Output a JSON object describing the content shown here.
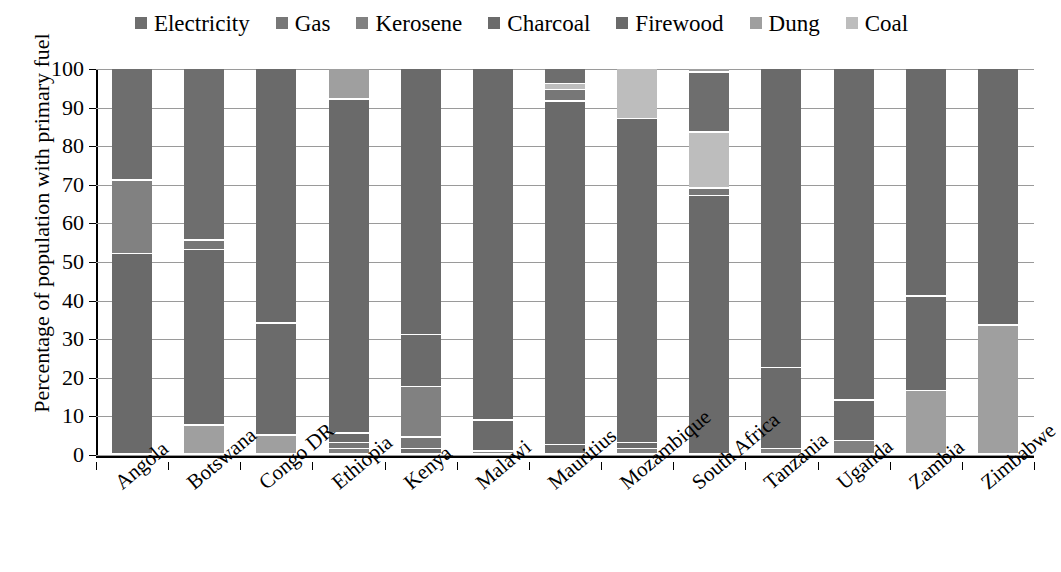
{
  "chart_data": {
    "type": "bar",
    "subtype": "stacked-bar-100",
    "title": "",
    "xlabel": "",
    "ylabel": "Percentage of population with primary fuel",
    "ylim": [
      0,
      100
    ],
    "ytick_labels": [
      "100",
      "90",
      "80",
      "70",
      "60",
      "50",
      "40",
      "30",
      "20",
      "10",
      "0"
    ],
    "yticks": [
      100,
      90,
      80,
      70,
      60,
      50,
      40,
      30,
      20,
      10,
      0
    ],
    "grid": true,
    "legend_position": "top-center",
    "categories": [
      "Angola",
      "Botswana",
      "Congo DR",
      "Ethiopia",
      "Kenya",
      "Malawi",
      "Mauritius",
      "Mozambique",
      "South Africa",
      "Tanzania",
      "Uganda",
      "Zambia",
      "Zimbabwe"
    ],
    "series": [
      {
        "name": "Electricity",
        "color": "#6e6e6e",
        "values": [
          29.0,
          44.5,
          0.0,
          0.0,
          1.5,
          0.0,
          4.0,
          0.0,
          15.5,
          0.0,
          0.0,
          0.0,
          0.0
        ]
      },
      {
        "name": "Gas",
        "color": "#777777",
        "values": [
          0.0,
          2.5,
          0.0,
          1.5,
          3.0,
          0.0,
          3.0,
          0.0,
          2.0,
          0.0,
          0.0,
          0.0,
          0.0
        ]
      },
      {
        "name": "Kerosene",
        "color": "#818181",
        "values": [
          19.0,
          0.0,
          0.0,
          1.5,
          13.0,
          0.8,
          0.0,
          1.5,
          0.0,
          1.5,
          3.5,
          0.0,
          0.0
        ]
      },
      {
        "name": "Charcoal",
        "color": "#6b6b6b",
        "values": [
          0.0,
          0.0,
          29.0,
          2.5,
          13.5,
          8.0,
          0.0,
          1.5,
          0.0,
          21.0,
          10.5,
          24.5,
          0.0
        ]
      },
      {
        "name": "Firewood",
        "color": "#6a6a6a",
        "values": [
          52.0,
          45.5,
          66.0,
          86.5,
          69.0,
          91.2,
          89.0,
          84.0,
          67.0,
          77.5,
          86.0,
          59.0,
          66.5
        ]
      },
      {
        "name": "Dung",
        "color": "#9f9f9f",
        "values": [
          0.0,
          7.5,
          5.0,
          8.0,
          0.0,
          0.0,
          0.0,
          0.0,
          1.0,
          0.0,
          0.0,
          16.5,
          33.5
        ]
      },
      {
        "name": "Coal",
        "color": "#bdbdbd",
        "values": [
          0.0,
          0.0,
          0.0,
          0.0,
          0.0,
          0.0,
          4.0,
          13.0,
          14.5,
          0.0,
          0.0,
          0.0,
          0.0
        ]
      }
    ],
    "stacks": [
      {
        "category": "Angola",
        "segments": [
          {
            "series": "Firewood",
            "from": 0,
            "to": 52.0
          },
          {
            "series": "Kerosene",
            "from": 52.0,
            "to": 71.0
          },
          {
            "series": "Electricity",
            "from": 71.0,
            "to": 100
          }
        ]
      },
      {
        "category": "Botswana",
        "segments": [
          {
            "series": "Dung",
            "from": 0,
            "to": 7.5
          },
          {
            "series": "Firewood",
            "from": 7.5,
            "to": 53.0
          },
          {
            "series": "Gas",
            "from": 53.0,
            "to": 55.5
          },
          {
            "series": "Electricity",
            "from": 55.5,
            "to": 100
          }
        ]
      },
      {
        "category": "Congo DR",
        "segments": [
          {
            "series": "Dung",
            "from": 0,
            "to": 5.0
          },
          {
            "series": "Charcoal",
            "from": 5.0,
            "to": 34.0
          },
          {
            "series": "Firewood",
            "from": 34.0,
            "to": 100
          }
        ]
      },
      {
        "category": "Ethiopia",
        "segments": [
          {
            "series": "Kerosene",
            "from": 0,
            "to": 1.5
          },
          {
            "series": "Gas",
            "from": 1.5,
            "to": 3.0
          },
          {
            "series": "Charcoal",
            "from": 3.0,
            "to": 5.5
          },
          {
            "series": "Firewood",
            "from": 5.5,
            "to": 92.0
          },
          {
            "series": "Dung",
            "from": 92.0,
            "to": 100
          }
        ]
      },
      {
        "category": "Kenya",
        "segments": [
          {
            "series": "Electricity",
            "from": 0,
            "to": 1.5
          },
          {
            "series": "Gas",
            "from": 1.5,
            "to": 4.5
          },
          {
            "series": "Kerosene",
            "from": 4.5,
            "to": 17.5
          },
          {
            "series": "Charcoal",
            "from": 17.5,
            "to": 31.0
          },
          {
            "series": "Firewood",
            "from": 31.0,
            "to": 100
          }
        ]
      },
      {
        "category": "Malawi",
        "segments": [
          {
            "series": "Kerosene",
            "from": 0,
            "to": 0.8
          },
          {
            "series": "Charcoal",
            "from": 0.8,
            "to": 8.8
          },
          {
            "series": "Firewood",
            "from": 8.8,
            "to": 100
          }
        ]
      },
      {
        "category": "Mauritius",
        "segments": [
          {
            "series": "Electricity",
            "from": 0,
            "to": 2.5
          },
          {
            "series": "Firewood",
            "from": 2.5,
            "to": 91.5
          },
          {
            "series": "Gas",
            "from": 91.5,
            "to": 94.5
          },
          {
            "series": "Coal",
            "from": 94.5,
            "to": 96.0
          },
          {
            "series": "Electricity",
            "from": 96.0,
            "to": 100
          }
        ]
      },
      {
        "category": "Mozambique",
        "segments": [
          {
            "series": "Kerosene",
            "from": 0,
            "to": 1.5
          },
          {
            "series": "Charcoal",
            "from": 1.5,
            "to": 3.0
          },
          {
            "series": "Firewood",
            "from": 3.0,
            "to": 87.0
          },
          {
            "series": "Coal",
            "from": 87.0,
            "to": 100
          }
        ]
      },
      {
        "category": "South Africa",
        "segments": [
          {
            "series": "Firewood",
            "from": 0,
            "to": 67.0
          },
          {
            "series": "Gas",
            "from": 67.0,
            "to": 69.0
          },
          {
            "series": "Coal",
            "from": 69.0,
            "to": 83.5
          },
          {
            "series": "Electricity",
            "from": 83.5,
            "to": 99.0
          },
          {
            "series": "Dung",
            "from": 99.0,
            "to": 100
          }
        ]
      },
      {
        "category": "Tanzania",
        "segments": [
          {
            "series": "Kerosene",
            "from": 0,
            "to": 1.5
          },
          {
            "series": "Charcoal",
            "from": 1.5,
            "to": 22.5
          },
          {
            "series": "Firewood",
            "from": 22.5,
            "to": 100
          }
        ]
      },
      {
        "category": "Uganda",
        "segments": [
          {
            "series": "Kerosene",
            "from": 0,
            "to": 3.5
          },
          {
            "series": "Charcoal",
            "from": 3.5,
            "to": 14.0
          },
          {
            "series": "Firewood",
            "from": 14.0,
            "to": 100
          }
        ]
      },
      {
        "category": "Zambia",
        "segments": [
          {
            "series": "Dung",
            "from": 0,
            "to": 16.5
          },
          {
            "series": "Charcoal",
            "from": 16.5,
            "to": 41.0
          },
          {
            "series": "Firewood",
            "from": 41.0,
            "to": 100
          }
        ]
      },
      {
        "category": "Zimbabwe",
        "segments": [
          {
            "series": "Dung",
            "from": 0,
            "to": 33.5
          },
          {
            "series": "Firewood",
            "from": 33.5,
            "to": 100
          }
        ]
      }
    ]
  }
}
